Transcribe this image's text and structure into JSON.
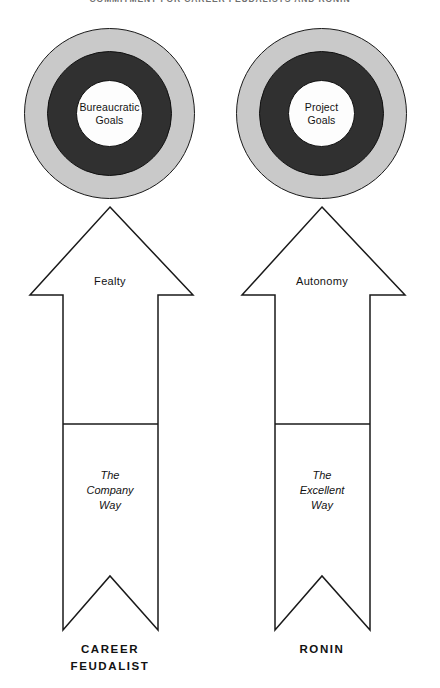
{
  "page": {
    "running_head": "COMMITMENT FOR CAREER FEUDALISTS AND RONIN",
    "background_color": "#ffffff",
    "ink_color": "#1a1a1a"
  },
  "palette": {
    "target_outer_ring": "#c9c9c9",
    "target_middle_ring": "#303030",
    "target_center": "#fdfdfd",
    "outline": "#1a1a1a"
  },
  "columns": [
    {
      "id": "career-feudalist",
      "target_label": "Bureaucratic\nGoals",
      "arrow_head_label": "Fealty",
      "arrow_shaft_label": "The\nCompany\nWay",
      "caption": "CAREER\nFEUDALIST"
    },
    {
      "id": "ronin",
      "target_label": "Project\nGoals",
      "arrow_head_label": "Autonomy",
      "arrow_shaft_label": "The\nExcellent\nWay",
      "caption": "RONIN"
    }
  ]
}
